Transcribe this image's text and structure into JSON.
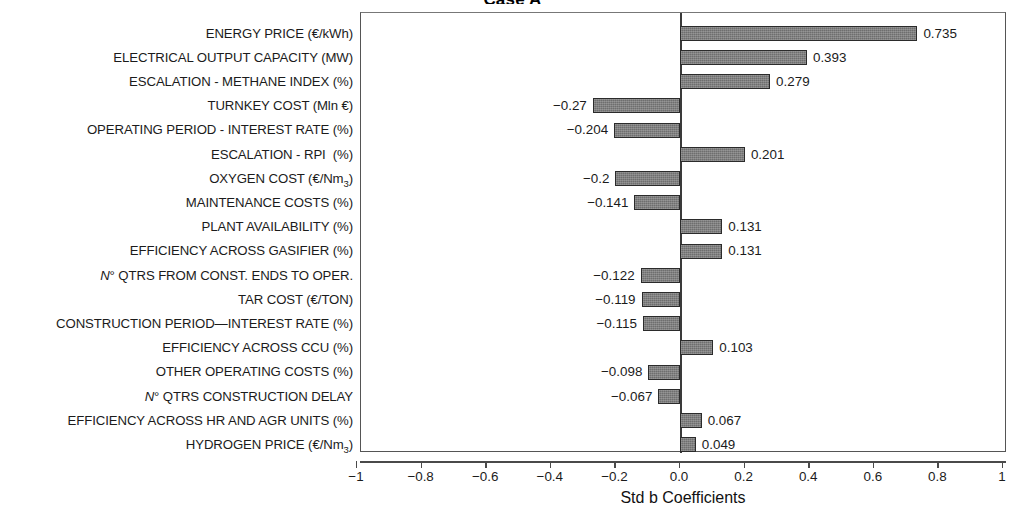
{
  "chart": {
    "title": "Case A",
    "xlabel": "Std b Coefficients"
  },
  "axis": {
    "ticks": [
      "−1",
      "−0.8",
      "−0.6",
      "−0.4",
      "−0.2",
      "0.0",
      "0.2",
      "0.4",
      "0.6",
      "0.8",
      "1"
    ],
    "tick_values": [
      -1,
      -0.8,
      -0.6,
      -0.4,
      -0.2,
      0,
      0.2,
      0.4,
      0.6,
      0.8,
      1
    ]
  },
  "chart_data": {
    "type": "bar",
    "orientation": "horizontal",
    "title": "Case A",
    "xlabel": "Std b Coefficients",
    "ylabel": "",
    "xlim": [
      -1,
      1
    ],
    "grid": false,
    "legend": null,
    "bar_color": "#6e6e6e",
    "bar_edge_color": "#2b2b2b",
    "categories": [
      "ENERGY PRICE (€/kWh)",
      "ELECTRICAL OUTPUT CAPACITY (MW)",
      "ESCALATION - METHANE INDEX (%)",
      "TURNKEY COST (Mln €)",
      "OPERATING PERIOD - INTEREST RATE (%)",
      "ESCALATION - RPI  (%)",
      "OXYGEN COST (€/Nm3)",
      "MAINTENANCE COSTS (%)",
      "PLANT AVAILABILITY (%)",
      "EFFICIENCY ACROSS GASIFIER (%)",
      "N° QTRS FROM CONST. ENDS TO OPER.",
      "TAR COST (€/TON)",
      "CONSTRUCTION PERIOD—INTEREST RATE (%)",
      "EFFICIENCY ACROSS CCU (%)",
      "OTHER OPERATING COSTS (%)",
      "N° QTRS CONSTRUCTION DELAY",
      "EFFICIENCY ACROSS HR AND AGR UNITS (%)",
      "HYDROGEN PRICE (€/Nm3)"
    ],
    "values": [
      0.735,
      0.393,
      0.279,
      -0.27,
      -0.204,
      0.201,
      -0.2,
      -0.141,
      0.131,
      0.131,
      -0.122,
      -0.119,
      -0.115,
      0.103,
      -0.098,
      -0.067,
      0.067,
      0.049
    ],
    "value_labels": [
      "0.735",
      "0.393",
      "0.279",
      "−0.27",
      "−0.204",
      "0.201",
      "−0.2",
      "−0.141",
      "0.131",
      "0.131",
      "−0.122",
      "−0.119",
      "−0.115",
      "0.103",
      "−0.098",
      "−0.067",
      "0.067",
      "0.049"
    ]
  },
  "rows": [
    {
      "label_html": "ENERGY PRICE (€/kWh)",
      "value": 0.735,
      "value_label": "0.735"
    },
    {
      "label_html": "ELECTRICAL OUTPUT CAPACITY (MW)",
      "value": 0.393,
      "value_label": "0.393"
    },
    {
      "label_html": "ESCALATION - METHANE INDEX (%)",
      "value": 0.279,
      "value_label": "0.279"
    },
    {
      "label_html": "TURNKEY COST (Mln €)",
      "value": -0.27,
      "value_label": "−0.27"
    },
    {
      "label_html": "OPERATING PERIOD - INTEREST RATE (%)",
      "value": -0.204,
      "value_label": "−0.204"
    },
    {
      "label_html": "ESCALATION - RPI&nbsp; (%)",
      "value": 0.201,
      "value_label": "0.201"
    },
    {
      "label_html": "OXYGEN COST (€/Nm<sub>3</sub>)",
      "value": -0.2,
      "value_label": "−0.2"
    },
    {
      "label_html": "MAINTENANCE COSTS (%)",
      "value": -0.141,
      "value_label": "−0.141"
    },
    {
      "label_html": "PLANT AVAILABILITY (%)",
      "value": 0.131,
      "value_label": "0.131"
    },
    {
      "label_html": "EFFICIENCY ACROSS GASIFIER (%)",
      "value": 0.131,
      "value_label": "0.131"
    },
    {
      "label_html": "<span class=\"it\">N</span>° QTRS FROM CONST. ENDS TO OPER.",
      "value": -0.122,
      "value_label": "−0.122"
    },
    {
      "label_html": "TAR COST (€/TON)",
      "value": -0.119,
      "value_label": "−0.119"
    },
    {
      "label_html": "CONSTRUCTION PERIOD—INTEREST RATE (%)",
      "value": -0.115,
      "value_label": "−0.115"
    },
    {
      "label_html": "EFFICIENCY ACROSS CCU (%)",
      "value": 0.103,
      "value_label": "0.103"
    },
    {
      "label_html": "OTHER OPERATING COSTS (%)",
      "value": -0.098,
      "value_label": "−0.098"
    },
    {
      "label_html": "<span class=\"it\">N</span>° QTRS CONSTRUCTION DELAY",
      "value": -0.067,
      "value_label": "−0.067"
    },
    {
      "label_html": "EFFICIENCY ACROSS HR AND AGR UNITS (%)",
      "value": 0.067,
      "value_label": "0.067"
    },
    {
      "label_html": "HYDROGEN PRICE (€/Nm<sub>3</sub>)",
      "value": 0.049,
      "value_label": "0.049"
    }
  ]
}
